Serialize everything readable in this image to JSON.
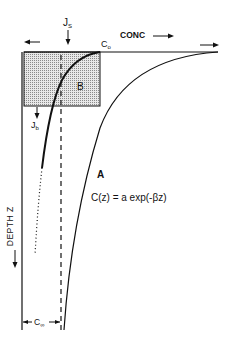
{
  "diagram": {
    "labels": {
      "js_main": "J",
      "js_sub": "S",
      "conc": "CONC",
      "c0_main": "C",
      "c0_sub": "o",
      "region_b": "B",
      "jb_main": "J",
      "jb_sub": "b",
      "curve_a": "A",
      "equation": "C(z) = a exp(-βz)",
      "depth_axis": "DEPTH  Z",
      "cinf_main": "C",
      "cinf_sub": "∞"
    },
    "colors": {
      "ink": "#111111",
      "background": "#ffffff",
      "stipple": "#9a9a9a"
    }
  }
}
